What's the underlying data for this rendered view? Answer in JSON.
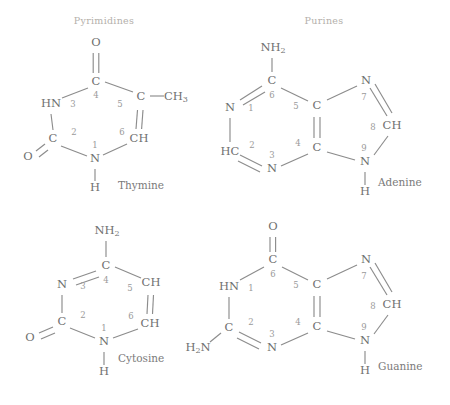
{
  "figure": {
    "groups": [
      {
        "label": "Pyrimidines",
        "x": 104,
        "y": 21
      },
      {
        "label": "Purines",
        "x": 324,
        "y": 21
      }
    ]
  },
  "molecules": {
    "thymine": {
      "name": "Thymine",
      "name_x": 118,
      "name_y": 186,
      "class": "Pyrimidines",
      "atoms": [
        {
          "id": "O4",
          "text": "O",
          "sub": "",
          "x": 96,
          "y": 43
        },
        {
          "id": "C4",
          "text": "C",
          "sub": "",
          "x": 96,
          "y": 82
        },
        {
          "id": "N3",
          "text": "HN",
          "sub": "",
          "x": 51,
          "y": 104
        },
        {
          "id": "C2",
          "text": "C",
          "sub": "",
          "x": 53,
          "y": 139
        },
        {
          "id": "O2",
          "text": "O",
          "sub": "",
          "x": 28,
          "y": 157
        },
        {
          "id": "N1",
          "text": "N",
          "sub": "",
          "x": 95,
          "y": 159
        },
        {
          "id": "C6",
          "text": "CH",
          "sub": "",
          "x": 139,
          "y": 139
        },
        {
          "id": "C5",
          "text": "C",
          "sub": "",
          "x": 141,
          "y": 97
        },
        {
          "id": "CM",
          "text": "CH",
          "sub": "3",
          "x": 176,
          "y": 97
        },
        {
          "id": "H1",
          "text": "H",
          "sub": "",
          "x": 95,
          "y": 188
        }
      ],
      "numbers": [
        {
          "n": "4",
          "x": 96,
          "y": 95
        },
        {
          "n": "3",
          "x": 73,
          "y": 104
        },
        {
          "n": "2",
          "x": 74,
          "y": 132
        },
        {
          "n": "1",
          "x": 95,
          "y": 145
        },
        {
          "n": "6",
          "x": 122,
          "y": 132
        },
        {
          "n": "5",
          "x": 120,
          "y": 104
        }
      ]
    },
    "adenine": {
      "name": "Adenine",
      "name_x": 378,
      "name_y": 183,
      "class": "Purines",
      "atoms": [
        {
          "id": "N6",
          "text": "NH",
          "sub": "2",
          "x": 273,
          "y": 48
        },
        {
          "id": "C6",
          "text": "C",
          "sub": "",
          "x": 272,
          "y": 81
        },
        {
          "id": "N1",
          "text": "N",
          "sub": "",
          "x": 230,
          "y": 108
        },
        {
          "id": "C2",
          "text": "HC",
          "sub": "",
          "x": 230,
          "y": 152
        },
        {
          "id": "N3",
          "text": "N",
          "sub": "",
          "x": 272,
          "y": 169
        },
        {
          "id": "C4",
          "text": "C",
          "sub": "",
          "x": 317,
          "y": 148
        },
        {
          "id": "C5",
          "text": "C",
          "sub": "",
          "x": 317,
          "y": 106
        },
        {
          "id": "N7",
          "text": "N",
          "sub": "",
          "x": 366,
          "y": 81
        },
        {
          "id": "C8",
          "text": "CH",
          "sub": "",
          "x": 392,
          "y": 126
        },
        {
          "id": "N9",
          "text": "N",
          "sub": "",
          "x": 365,
          "y": 162
        },
        {
          "id": "H9",
          "text": "H",
          "sub": "",
          "x": 365,
          "y": 192
        }
      ],
      "numbers": [
        {
          "n": "6",
          "x": 272,
          "y": 95
        },
        {
          "n": "1",
          "x": 251,
          "y": 108
        },
        {
          "n": "2",
          "x": 252,
          "y": 145
        },
        {
          "n": "3",
          "x": 272,
          "y": 155
        },
        {
          "n": "4",
          "x": 298,
          "y": 143
        },
        {
          "n": "5",
          "x": 296,
          "y": 106
        },
        {
          "n": "7",
          "x": 364,
          "y": 97
        },
        {
          "n": "8",
          "x": 373,
          "y": 127
        },
        {
          "n": "9",
          "x": 364,
          "y": 148
        }
      ]
    },
    "cytosine": {
      "name": "Cytosine",
      "name_x": 118,
      "name_y": 359,
      "class": "Pyrimidines",
      "atoms": [
        {
          "id": "N4",
          "text": "NH",
          "sub": "2",
          "x": 107,
          "y": 231
        },
        {
          "id": "C4",
          "text": "C",
          "sub": "",
          "x": 106,
          "y": 266
        },
        {
          "id": "N3",
          "text": "N",
          "sub": "",
          "x": 62,
          "y": 285
        },
        {
          "id": "C2",
          "text": "C",
          "sub": "",
          "x": 62,
          "y": 322
        },
        {
          "id": "O2",
          "text": "O",
          "sub": "",
          "x": 30,
          "y": 338
        },
        {
          "id": "N1",
          "text": "N",
          "sub": "",
          "x": 104,
          "y": 342
        },
        {
          "id": "C6",
          "text": "CH",
          "sub": "",
          "x": 150,
          "y": 324
        },
        {
          "id": "C5",
          "text": "CH",
          "sub": "",
          "x": 151,
          "y": 283
        },
        {
          "id": "H1",
          "text": "H",
          "sub": "",
          "x": 104,
          "y": 372
        }
      ],
      "numbers": [
        {
          "n": "4",
          "x": 106,
          "y": 280
        },
        {
          "n": "3",
          "x": 83,
          "y": 286
        },
        {
          "n": "2",
          "x": 83,
          "y": 315
        },
        {
          "n": "1",
          "x": 104,
          "y": 328
        },
        {
          "n": "6",
          "x": 131,
          "y": 316
        },
        {
          "n": "5",
          "x": 130,
          "y": 288
        }
      ]
    },
    "guanine": {
      "name": "Guanine",
      "name_x": 378,
      "name_y": 367,
      "class": "Purines",
      "atoms": [
        {
          "id": "O6",
          "text": "O",
          "sub": "",
          "x": 273,
          "y": 227
        },
        {
          "id": "C6",
          "text": "C",
          "sub": "",
          "x": 273,
          "y": 260
        },
        {
          "id": "N1",
          "text": "HN",
          "sub": "",
          "x": 229,
          "y": 287
        },
        {
          "id": "C2",
          "text": "C",
          "sub": "",
          "x": 229,
          "y": 328
        },
        {
          "id": "N2",
          "text": "H",
          "sub": "2N",
          "x": 198,
          "y": 348
        },
        {
          "id": "N3",
          "text": "N",
          "sub": "",
          "x": 272,
          "y": 348
        },
        {
          "id": "C4",
          "text": "C",
          "sub": "",
          "x": 317,
          "y": 327
        },
        {
          "id": "C5",
          "text": "C",
          "sub": "",
          "x": 317,
          "y": 285
        },
        {
          "id": "N7",
          "text": "N",
          "sub": "",
          "x": 366,
          "y": 260
        },
        {
          "id": "C8",
          "text": "CH",
          "sub": "",
          "x": 392,
          "y": 305
        },
        {
          "id": "N9",
          "text": "N",
          "sub": "",
          "x": 365,
          "y": 341
        },
        {
          "id": "H9",
          "text": "H",
          "sub": "",
          "x": 365,
          "y": 371
        }
      ],
      "numbers": [
        {
          "n": "6",
          "x": 273,
          "y": 274
        },
        {
          "n": "1",
          "x": 251,
          "y": 288
        },
        {
          "n": "2",
          "x": 251,
          "y": 322
        },
        {
          "n": "3",
          "x": 272,
          "y": 334
        },
        {
          "n": "4",
          "x": 298,
          "y": 322
        },
        {
          "n": "5",
          "x": 296,
          "y": 285
        },
        {
          "n": "7",
          "x": 364,
          "y": 276
        },
        {
          "n": "8",
          "x": 373,
          "y": 306
        },
        {
          "n": "9",
          "x": 364,
          "y": 327
        }
      ]
    }
  },
  "colors": {
    "bond": "#8c8c8c",
    "atom_text": "#707070",
    "number_text": "#9a9a9a",
    "group_title": "#b4b0ab",
    "background": "#ffffff"
  }
}
